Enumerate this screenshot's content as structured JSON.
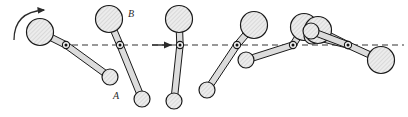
{
  "figure": {
    "width": 408,
    "height": 117,
    "background_color": "#ffffff",
    "body_fill_color": "#e6e6e6",
    "body_stroke_color": "#1a1a1a",
    "rod_fill_color": "#dcdcdc",
    "hatch_color": "#b9b9b9",
    "trajectory_color": "#333333",
    "label_color": "#2b2b2b"
  },
  "labels": {
    "big_ball": "B",
    "small_ball": "A"
  },
  "label_positions": {
    "big_ball": {
      "x": 131,
      "y": 17
    },
    "small_ball": {
      "x": 116,
      "y": 99
    }
  },
  "trajectory": {
    "name": "mass-center-path",
    "y": 45,
    "x_start": 72,
    "x_end": 404,
    "dash_pattern": "6 4",
    "stroke_width": 1.2,
    "arrow": {
      "name": "direction-arrow",
      "x": 168,
      "y": 45,
      "points_right": true
    }
  },
  "rotation_arrow": {
    "name": "rotation-direction-arrow",
    "description": "curved arrow above first big ball indicating spin",
    "path": "M 14 40 Q 14 12 44 10",
    "arrow_tip": {
      "x": 44,
      "y": 10
    }
  },
  "geometry": {
    "big_radius": 13.5,
    "small_radius": 8.0,
    "rod_half_width": 3.2,
    "pivot_outer_radius": 3.6,
    "pivot_inner_radius": 1.5
  },
  "positions": [
    {
      "index": 1,
      "name": "linkage-position-1",
      "pivot": {
        "x": 66,
        "y": 45
      },
      "big_ball": {
        "x": 40,
        "y": 32
      },
      "small_ball": {
        "x": 110,
        "y": 77
      },
      "rotation_deg": 27
    },
    {
      "index": 2,
      "name": "linkage-position-2",
      "pivot": {
        "x": 120,
        "y": 45
      },
      "big_ball": {
        "x": 109,
        "y": 19
      },
      "small_ball": {
        "x": 142,
        "y": 99
      },
      "rotation_deg": 72
    },
    {
      "index": 3,
      "name": "linkage-position-3",
      "pivot": {
        "x": 180,
        "y": 45
      },
      "big_ball": {
        "x": 179,
        "y": 19
      },
      "small_ball": {
        "x": 174,
        "y": 101
      },
      "rotation_deg": 90
    },
    {
      "index": 4,
      "name": "linkage-position-4",
      "pivot": {
        "x": 237,
        "y": 45
      },
      "big_ball": {
        "x": 254,
        "y": 25
      },
      "small_ball": {
        "x": 207,
        "y": 90
      },
      "rotation_deg": 128
    },
    {
      "index": 5,
      "name": "linkage-position-5",
      "pivot": {
        "x": 293,
        "y": 45
      },
      "big_ball": {
        "x": 304,
        "y": 27
      },
      "small_ball": {
        "x": 246,
        "y": 60
      },
      "rotation_deg": 160
    },
    {
      "index": 6,
      "name": "linkage-position-6",
      "pivot": {
        "x": 348,
        "y": 45
      },
      "big_ball": {
        "x": 318,
        "y": 30
      },
      "small_ball": {
        "x": 312,
        "y": 36
      },
      "rotation_deg": 188
    },
    {
      "index": 7,
      "name": "linkage-position-7",
      "pivot": {
        "x": 348,
        "y": 45
      },
      "big_ball": {
        "x": 381,
        "y": 60
      },
      "small_ball": {
        "x": 311,
        "y": 31
      },
      "rotation_deg": 205
    }
  ]
}
